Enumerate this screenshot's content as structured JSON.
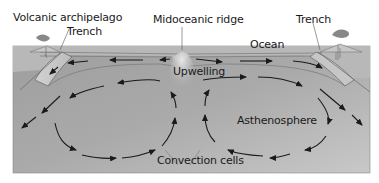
{
  "labels": {
    "volcanic_archipelago": "Volcanic archipelago",
    "trench_left": "Trench",
    "midoceanic_ridge": "Midoceanic ridge",
    "trench_right": "Trench",
    "ocean": "Ocean",
    "upwelling": "Upwelling",
    "asthenosphere": "Asthenosphere",
    "convection_cells": "Convection cells"
  },
  "colors": {
    "mantle": "#a9a9a9",
    "mantle_light": "#c4c4c4",
    "plate": "#bdbdbd",
    "ocean_band": "#d4d4d4",
    "arrow": "#1a1a1a",
    "outline": "#555555",
    "background": "#ffffff"
  }
}
